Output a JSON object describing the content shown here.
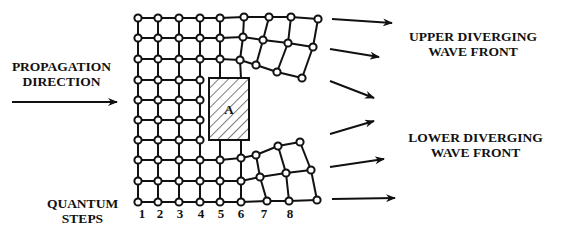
{
  "labels": {
    "propagation": [
      "PROPAGATION",
      "DIRECTION"
    ],
    "upper": [
      "UPPER DIVERGING",
      "WAVE FRONT"
    ],
    "lower": [
      "LOWER DIVERGING",
      "WAVE FRONT"
    ],
    "steps": [
      "QUANTUM",
      "STEPS"
    ],
    "obstacle": "A"
  },
  "step_numbers": [
    "1",
    "2",
    "3",
    "4",
    "5",
    "6",
    "7",
    "8"
  ],
  "colors": {
    "ink": "#111111",
    "background": "#ffffff"
  }
}
